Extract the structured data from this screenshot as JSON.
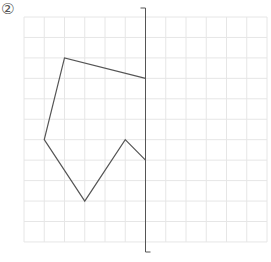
{
  "problem": {
    "label": "②"
  },
  "grid": {
    "origin_x": 24,
    "origin_y": 17,
    "cell_w": 20.25,
    "cell_h": 20.45,
    "cols": 12,
    "rows": 11,
    "line_color": "#e6e6e6"
  },
  "axis": {
    "col": 6,
    "top_y": 8,
    "bottom_y": 252,
    "color": "#555555"
  },
  "figure": {
    "stroke": "#555555",
    "vertices": [
      [
        2,
        2
      ],
      [
        6,
        3
      ],
      [
        6,
        7
      ],
      [
        5,
        6
      ],
      [
        3,
        9
      ],
      [
        1,
        6
      ]
    ],
    "closed_on_axis": true
  },
  "chart_data": {
    "type": "diagram",
    "title": "②",
    "grid_cols": 12,
    "grid_rows": 11,
    "symmetry_axis_col": 6,
    "polyline_vertices_grid": [
      [
        6,
        3
      ],
      [
        2,
        2
      ],
      [
        1,
        6
      ],
      [
        3,
        9
      ],
      [
        5,
        6
      ],
      [
        6,
        7
      ]
    ]
  }
}
